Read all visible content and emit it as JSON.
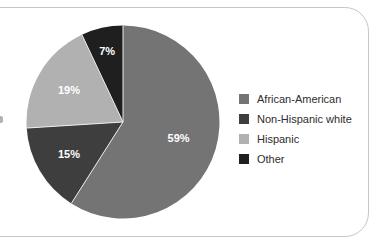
{
  "card": {
    "background": "#ffffff",
    "border_color": "#c6c6c6"
  },
  "chart_data": {
    "type": "pie",
    "title": "",
    "start_angle_deg": 0,
    "direction": "clockwise",
    "label_color": "#ffffff",
    "separator_color": "#ececec",
    "slices": [
      {
        "label": "African-American",
        "value": 59,
        "display": "59%",
        "color": "#747474"
      },
      {
        "label": "Non-Hispanic white",
        "value": 15,
        "display": "15%",
        "color": "#3e3e3e"
      },
      {
        "label": "Hispanic",
        "value": 19,
        "display": "19%",
        "color": "#b1b1b1"
      },
      {
        "label": "Other",
        "value": 7,
        "display": "7%",
        "color": "#1f1f1f"
      }
    ],
    "legend": {
      "position": "right",
      "text_color": "#2e2e2e"
    }
  }
}
